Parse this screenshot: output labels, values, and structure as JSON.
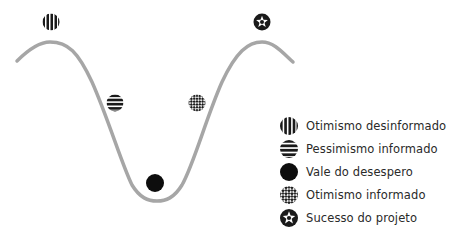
{
  "diagram": {
    "type": "change-curve",
    "curve_color": "#a6a6a6",
    "marker_color": "#111111",
    "stages": [
      {
        "id": "uninformed-optimism",
        "label": "Otimismo desinformado",
        "pattern": "vertical-stripes",
        "icon": "vertical-stripes-circle-icon"
      },
      {
        "id": "informed-pessimism",
        "label": "Pessimismo informado",
        "pattern": "horizontal-stripes",
        "icon": "horizontal-stripes-circle-icon"
      },
      {
        "id": "valley-of-despair",
        "label": "Vale do desespero",
        "pattern": "solid",
        "icon": "solid-circle-icon"
      },
      {
        "id": "informed-optimism",
        "label": "Otimismo informado",
        "pattern": "checker",
        "icon": "checker-circle-icon"
      },
      {
        "id": "project-success",
        "label": "Sucesso do projeto",
        "pattern": "star",
        "icon": "star-circle-icon"
      }
    ]
  },
  "legend": {
    "items": [
      {
        "label": "Otimismo desinformado"
      },
      {
        "label": "Pessimismo informado"
      },
      {
        "label": "Vale do desespero"
      },
      {
        "label": "Otimismo informado"
      },
      {
        "label": "Sucesso do projeto"
      }
    ]
  }
}
